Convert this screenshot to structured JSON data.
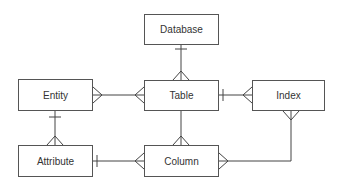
{
  "diagram": {
    "type": "entity-relationship",
    "notation": "crows-foot",
    "entities": [
      {
        "id": "database",
        "label": "Database"
      },
      {
        "id": "entity",
        "label": "Entity"
      },
      {
        "id": "table",
        "label": "Table"
      },
      {
        "id": "index",
        "label": "Index"
      },
      {
        "id": "attribute",
        "label": "Attribute"
      },
      {
        "id": "column",
        "label": "Column"
      }
    ],
    "relationships": [
      {
        "from": "database",
        "to": "table",
        "from_end": "one",
        "to_end": "many"
      },
      {
        "from": "entity",
        "to": "table",
        "from_end": "many",
        "to_end": "many"
      },
      {
        "from": "table",
        "to": "index",
        "from_end": "one",
        "to_end": "many"
      },
      {
        "from": "entity",
        "to": "attribute",
        "from_end": "one",
        "to_end": "many"
      },
      {
        "from": "table",
        "to": "column",
        "from_end": "one",
        "to_end": "many"
      },
      {
        "from": "attribute",
        "to": "column",
        "from_end": "one",
        "to_end": "many"
      },
      {
        "from": "index",
        "to": "column",
        "from_end": "many",
        "to_end": "many"
      }
    ]
  }
}
